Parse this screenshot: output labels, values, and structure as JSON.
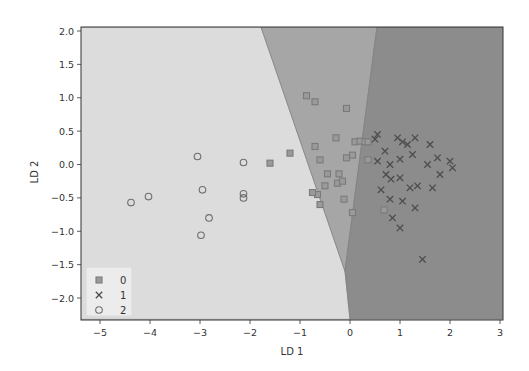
{
  "chart_data": {
    "type": "scatter",
    "title": "",
    "xlabel": "LD 1",
    "ylabel": "LD 2",
    "xlim": [
      -5.4,
      3.05
    ],
    "ylim": [
      -2.32,
      2.06
    ],
    "xticks": [
      -5,
      -4,
      -3,
      -2,
      -1,
      0,
      1,
      2,
      3
    ],
    "yticks": [
      -2.0,
      -1.5,
      -1.0,
      -0.5,
      0.0,
      0.5,
      1.0,
      1.5,
      2.0
    ],
    "xtick_labels": [
      "−5",
      "−4",
      "−3",
      "−2",
      "−1",
      "0",
      "1",
      "2",
      "3"
    ],
    "ytick_labels": [
      "−2.0",
      "−1.5",
      "−1.0",
      "−0.5",
      "0.0",
      "0.5",
      "1.0",
      "1.5",
      "2.0"
    ],
    "grid": false,
    "legend_position": "lower left",
    "decision_regions": [
      {
        "class": "2",
        "color": "#dcdcdc",
        "polygon": [
          [
            -5.4,
            2.06
          ],
          [
            -1.78,
            2.06
          ],
          [
            -0.1,
            -1.6
          ],
          [
            0.0,
            -2.32
          ],
          [
            -5.4,
            -2.32
          ]
        ]
      },
      {
        "class": "0",
        "color": "#a6a6a6",
        "polygon": [
          [
            -1.78,
            2.06
          ],
          [
            0.54,
            2.06
          ],
          [
            -0.1,
            -1.6
          ]
        ]
      },
      {
        "class": "1",
        "color": "#8c8c8c",
        "polygon": [
          [
            0.54,
            2.06
          ],
          [
            3.05,
            2.06
          ],
          [
            3.05,
            -2.32
          ],
          [
            0.0,
            -2.32
          ],
          [
            -0.1,
            -1.6
          ]
        ]
      }
    ],
    "series": [
      {
        "name": "0",
        "marker": "square",
        "color": "#7a7a7a",
        "points": [
          [
            -0.87,
            1.03
          ],
          [
            -0.7,
            0.94
          ],
          [
            -0.07,
            0.84
          ],
          [
            -0.28,
            0.4
          ],
          [
            -0.7,
            0.27
          ],
          [
            -1.2,
            0.17
          ],
          [
            -0.6,
            0.07
          ],
          [
            0.1,
            0.34
          ],
          [
            0.2,
            0.35
          ],
          [
            0.3,
            0.34
          ],
          [
            0.36,
            0.34
          ],
          [
            0.05,
            0.14
          ],
          [
            -0.45,
            -0.14
          ],
          [
            -0.22,
            -0.14
          ],
          [
            -0.5,
            -0.32
          ],
          [
            -0.25,
            -0.28
          ],
          [
            -0.15,
            -0.25
          ],
          [
            -0.07,
            0.1
          ],
          [
            -0.65,
            -0.45
          ],
          [
            -0.75,
            -0.42
          ],
          [
            -0.6,
            -0.6
          ],
          [
            0.05,
            -0.72
          ],
          [
            -0.12,
            -0.52
          ],
          [
            -1.6,
            0.02
          ],
          [
            0.68,
            -0.68
          ],
          [
            0.36,
            0.07
          ]
        ]
      },
      {
        "name": "1",
        "marker": "x",
        "color": "#4d4d4d",
        "points": [
          [
            0.55,
            0.45
          ],
          [
            0.5,
            0.38
          ],
          [
            0.95,
            0.4
          ],
          [
            1.15,
            0.3
          ],
          [
            1.05,
            0.34
          ],
          [
            1.3,
            0.4
          ],
          [
            0.7,
            0.2
          ],
          [
            0.55,
            0.05
          ],
          [
            0.8,
            0.0
          ],
          [
            1.0,
            0.08
          ],
          [
            1.25,
            0.15
          ],
          [
            1.55,
            0.0
          ],
          [
            1.75,
            0.1
          ],
          [
            1.6,
            0.3
          ],
          [
            1.8,
            -0.15
          ],
          [
            2.05,
            -0.05
          ],
          [
            2.0,
            0.05
          ],
          [
            0.72,
            -0.15
          ],
          [
            0.82,
            -0.22
          ],
          [
            1.0,
            -0.2
          ],
          [
            1.2,
            -0.35
          ],
          [
            0.62,
            -0.38
          ],
          [
            1.35,
            -0.32
          ],
          [
            1.65,
            -0.35
          ],
          [
            0.8,
            -0.52
          ],
          [
            1.05,
            -0.55
          ],
          [
            1.3,
            -0.65
          ],
          [
            1.0,
            -0.95
          ],
          [
            1.45,
            -1.42
          ],
          [
            0.85,
            -0.8
          ]
        ]
      },
      {
        "name": "2",
        "marker": "o",
        "color": "#6e6e6e",
        "points": [
          [
            -3.05,
            0.12
          ],
          [
            -2.13,
            0.03
          ],
          [
            -2.95,
            -0.38
          ],
          [
            -2.13,
            -0.44
          ],
          [
            -2.13,
            -0.5
          ],
          [
            -4.03,
            -0.48
          ],
          [
            -4.38,
            -0.57
          ],
          [
            -2.82,
            -0.8
          ],
          [
            -2.98,
            -1.06
          ]
        ]
      }
    ],
    "legend": [
      {
        "label": "0",
        "marker": "square"
      },
      {
        "label": "1",
        "marker": "x"
      },
      {
        "label": "2",
        "marker": "o"
      }
    ]
  }
}
